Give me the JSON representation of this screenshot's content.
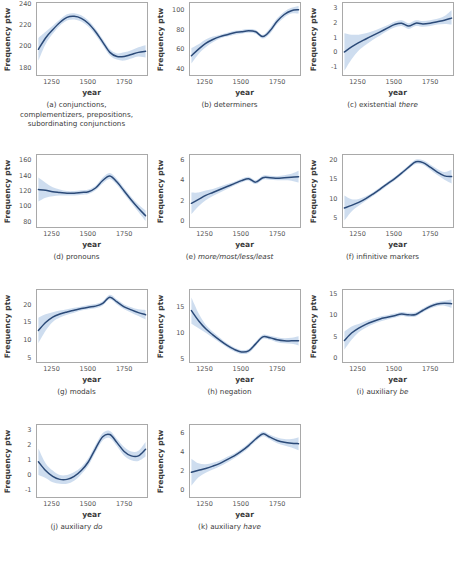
{
  "figure": {
    "axis_labels": {
      "y": "Frequency ptw",
      "x": "year"
    },
    "colors": {
      "line": "#2b4a78",
      "band": "#c6d7ec",
      "border": "#a9a9a9",
      "text": "#3a3a3a"
    }
  },
  "chart_data": [
    {
      "type": "line",
      "panel": "a",
      "caption_lines": [
        "(a) conjunctions,",
        "complementizers, prepositions,",
        "subordinating conjunctions"
      ],
      "caption_plain": "(a) conjunctions, complementizers, prepositions, subordinating conjunctions",
      "title": "conjunctions, complementizers, prepositions, subordinating conjunctions",
      "xlabel": "year",
      "ylabel": "Frequency ptw",
      "xlim": [
        1140,
        1910
      ],
      "ylim": [
        172,
        242
      ],
      "xticks": [
        1250,
        1500,
        1750
      ],
      "yticks": [
        180,
        200,
        220,
        240
      ],
      "grid": false,
      "legend": "none",
      "x": [
        1150,
        1200,
        1250,
        1300,
        1350,
        1400,
        1450,
        1500,
        1550,
        1600,
        1650,
        1700,
        1750,
        1800,
        1850,
        1900
      ],
      "y": [
        197,
        208,
        216,
        223,
        228,
        229,
        227,
        222,
        214,
        204,
        194,
        190,
        190,
        192,
        194,
        195
      ],
      "ci_low": [
        186,
        202,
        212,
        220,
        225,
        226,
        224,
        219,
        211,
        201,
        191,
        187,
        186,
        188,
        190,
        189
      ],
      "ci_high": [
        208,
        214,
        220,
        226,
        231,
        232,
        230,
        225,
        217,
        207,
        197,
        193,
        194,
        196,
        199,
        201
      ]
    },
    {
      "type": "line",
      "panel": "b",
      "caption_lines": [
        "(b) determiners"
      ],
      "caption_plain": "(b) determiners",
      "title": "determiners",
      "xlabel": "year",
      "ylabel": "Frequency ptw",
      "xlim": [
        1140,
        1910
      ],
      "ylim": [
        33,
        108
      ],
      "xticks": [
        1250,
        1500,
        1750
      ],
      "yticks": [
        40,
        60,
        80,
        100
      ],
      "grid": false,
      "legend": "none",
      "x": [
        1150,
        1200,
        1250,
        1300,
        1350,
        1400,
        1450,
        1500,
        1550,
        1600,
        1650,
        1700,
        1750,
        1800,
        1850,
        1900
      ],
      "y": [
        53,
        60,
        66,
        70,
        73,
        75,
        77,
        78,
        79,
        78,
        73,
        79,
        89,
        96,
        100,
        101
      ],
      "ci_low": [
        45,
        55,
        62,
        67,
        71,
        73,
        75,
        76,
        77,
        76,
        71,
        76,
        86,
        93,
        97,
        97
      ],
      "ci_high": [
        61,
        65,
        70,
        73,
        75,
        77,
        79,
        80,
        81,
        80,
        75,
        82,
        92,
        99,
        103,
        105
      ]
    },
    {
      "type": "line",
      "panel": "c",
      "caption_lines": [
        "(c) existential there"
      ],
      "caption_plain": "(c) existential there",
      "caption_italic_tail": "there",
      "title": "existential there",
      "xlabel": "year",
      "ylabel": "Frequency ptw",
      "xlim": [
        1140,
        1910
      ],
      "ylim": [
        -1.6,
        3.4
      ],
      "xticks": [
        1250,
        1500,
        1750
      ],
      "yticks": [
        -1,
        0,
        1,
        2,
        3
      ],
      "grid": false,
      "legend": "none",
      "x": [
        1150,
        1200,
        1250,
        1300,
        1350,
        1400,
        1450,
        1500,
        1550,
        1600,
        1650,
        1700,
        1750,
        1800,
        1850,
        1900
      ],
      "y": [
        0.0,
        0.35,
        0.65,
        0.9,
        1.15,
        1.4,
        1.65,
        1.9,
        2.0,
        1.8,
        2.0,
        1.95,
        2.0,
        2.1,
        2.2,
        2.35
      ],
      "ci_low": [
        -1.3,
        -0.5,
        0.1,
        0.5,
        0.85,
        1.15,
        1.45,
        1.7,
        1.8,
        1.6,
        1.8,
        1.75,
        1.8,
        1.9,
        1.95,
        1.9
      ],
      "ci_high": [
        1.3,
        1.2,
        1.2,
        1.3,
        1.45,
        1.65,
        1.85,
        2.1,
        2.2,
        2.0,
        2.2,
        2.15,
        2.2,
        2.3,
        2.5,
        2.9
      ]
    },
    {
      "type": "line",
      "panel": "d",
      "caption_lines": [
        "(d) pronouns"
      ],
      "caption_plain": "(d) pronouns",
      "title": "pronouns",
      "xlabel": "year",
      "ylabel": "Frequency ptw",
      "xlim": [
        1140,
        1910
      ],
      "ylim": [
        72,
        168
      ],
      "xticks": [
        1250,
        1500,
        1750
      ],
      "yticks": [
        80,
        100,
        120,
        140,
        160
      ],
      "grid": false,
      "legend": "none",
      "x": [
        1150,
        1200,
        1250,
        1300,
        1350,
        1400,
        1450,
        1500,
        1550,
        1600,
        1650,
        1700,
        1750,
        1800,
        1850,
        1900
      ],
      "y": [
        122,
        121,
        119,
        118,
        117,
        117,
        118,
        119,
        124,
        134,
        140,
        132,
        120,
        108,
        97,
        87
      ],
      "ci_low": [
        106,
        111,
        113,
        114,
        114,
        114,
        115,
        116,
        121,
        130,
        136,
        128,
        116,
        104,
        92,
        80
      ],
      "ci_high": [
        138,
        131,
        125,
        122,
        120,
        120,
        121,
        122,
        127,
        138,
        144,
        136,
        124,
        112,
        102,
        94
      ]
    },
    {
      "type": "line",
      "panel": "e",
      "caption_lines": [
        "(e) more/most/less/least"
      ],
      "caption_plain": "(e) more/most/less/least",
      "caption_italic_tail": "more/most/less/least",
      "title": "more/most/less/least",
      "xlabel": "year",
      "ylabel": "Frequency ptw",
      "xlim": [
        1140,
        1910
      ],
      "ylim": [
        -0.7,
        6.6
      ],
      "xticks": [
        1250,
        1500,
        1750
      ],
      "yticks": [
        0,
        2,
        4,
        6
      ],
      "grid": false,
      "legend": "none",
      "x": [
        1150,
        1200,
        1250,
        1300,
        1350,
        1400,
        1450,
        1500,
        1550,
        1600,
        1650,
        1700,
        1750,
        1800,
        1850,
        1900
      ],
      "y": [
        1.7,
        2.1,
        2.5,
        2.8,
        3.1,
        3.4,
        3.7,
        4.0,
        4.2,
        3.85,
        4.3,
        4.3,
        4.25,
        4.3,
        4.35,
        4.4
      ],
      "ci_low": [
        0.6,
        1.4,
        2.0,
        2.45,
        2.8,
        3.15,
        3.5,
        3.8,
        4.0,
        3.65,
        4.1,
        4.1,
        4.05,
        4.05,
        4.0,
        3.8
      ],
      "ci_high": [
        2.8,
        2.8,
        3.0,
        3.15,
        3.4,
        3.65,
        3.9,
        4.2,
        4.4,
        4.05,
        4.5,
        4.5,
        4.45,
        4.55,
        4.7,
        5.0
      ]
    },
    {
      "type": "line",
      "panel": "f",
      "caption_lines": [
        "(f) infinitive markers"
      ],
      "caption_plain": "(f) infinitive markers",
      "title": "infinitive markers",
      "xlabel": "year",
      "ylabel": "Frequency ptw",
      "xlim": [
        1140,
        1910
      ],
      "ylim": [
        2.5,
        21.5
      ],
      "xticks": [
        1250,
        1500,
        1750
      ],
      "yticks": [
        5,
        10,
        15,
        20
      ],
      "grid": false,
      "legend": "none",
      "x": [
        1150,
        1200,
        1250,
        1300,
        1350,
        1400,
        1450,
        1500,
        1550,
        1600,
        1650,
        1700,
        1750,
        1800,
        1850,
        1900
      ],
      "y": [
        7.5,
        8.2,
        9.0,
        10.0,
        11.2,
        12.5,
        13.9,
        15.2,
        16.7,
        18.3,
        19.7,
        19.5,
        18.3,
        17.0,
        16.0,
        15.8
      ],
      "ci_low": [
        4.2,
        6.6,
        8.1,
        9.4,
        10.7,
        12.0,
        13.4,
        14.7,
        16.2,
        17.8,
        19.1,
        18.9,
        17.6,
        16.2,
        15.0,
        14.0
      ],
      "ci_high": [
        10.8,
        9.8,
        9.9,
        10.6,
        11.7,
        13.0,
        14.4,
        15.7,
        17.2,
        18.8,
        20.3,
        20.1,
        19.0,
        17.8,
        17.0,
        17.6
      ]
    },
    {
      "type": "line",
      "panel": "g",
      "caption_lines": [
        "(g) modals"
      ],
      "caption_plain": "(g) modals",
      "title": "modals",
      "xlabel": "year",
      "ylabel": "Frequency ptw",
      "xlim": [
        1140,
        1910
      ],
      "ylim": [
        3.5,
        24.5
      ],
      "xticks": [
        1250,
        1500,
        1750
      ],
      "yticks": [
        5,
        10,
        15,
        20
      ],
      "grid": false,
      "legend": "none",
      "x": [
        1150,
        1200,
        1250,
        1300,
        1350,
        1400,
        1450,
        1500,
        1550,
        1600,
        1650,
        1700,
        1750,
        1800,
        1850,
        1900
      ],
      "y": [
        12.7,
        15.0,
        16.6,
        17.5,
        18.1,
        18.6,
        19.1,
        19.5,
        19.8,
        20.6,
        22.4,
        21.0,
        19.6,
        18.7,
        17.9,
        17.3
      ],
      "ci_low": [
        9.0,
        12.6,
        15.2,
        16.5,
        17.3,
        17.9,
        18.5,
        18.9,
        19.2,
        20.0,
        21.7,
        20.3,
        18.9,
        17.9,
        16.9,
        15.9
      ],
      "ci_high": [
        16.4,
        17.4,
        18.0,
        18.5,
        18.9,
        19.3,
        19.7,
        20.1,
        20.4,
        21.2,
        23.1,
        21.7,
        20.3,
        19.5,
        18.9,
        18.7
      ]
    },
    {
      "type": "line",
      "panel": "h",
      "caption_lines": [
        "(h) negation"
      ],
      "caption_plain": "(h) negation",
      "title": "negation",
      "xlabel": "year",
      "ylabel": "Frequency ptw",
      "xlim": [
        1140,
        1910
      ],
      "ylim": [
        4.2,
        18.5
      ],
      "xticks": [
        1250,
        1500,
        1750
      ],
      "yticks": [
        5,
        10,
        15
      ],
      "grid": false,
      "legend": "none",
      "x": [
        1150,
        1200,
        1250,
        1300,
        1350,
        1400,
        1450,
        1500,
        1550,
        1600,
        1650,
        1700,
        1750,
        1800,
        1850,
        1900
      ],
      "y": [
        14.4,
        12.4,
        10.8,
        9.6,
        8.5,
        7.5,
        6.7,
        6.2,
        6.4,
        7.8,
        9.2,
        9.0,
        8.6,
        8.4,
        8.4,
        8.4
      ],
      "ci_low": [
        11.8,
        10.9,
        10.0,
        9.0,
        8.0,
        7.1,
        6.3,
        5.8,
        6.0,
        7.4,
        8.8,
        8.6,
        8.1,
        7.9,
        7.8,
        7.5
      ],
      "ci_high": [
        17.0,
        13.9,
        11.6,
        10.2,
        9.0,
        7.9,
        7.1,
        6.6,
        6.8,
        8.2,
        9.6,
        9.4,
        9.1,
        8.9,
        9.0,
        9.3
      ]
    },
    {
      "type": "line",
      "panel": "i",
      "caption_lines": [
        "(i) auxiliary be"
      ],
      "caption_plain": "(i) auxiliary be",
      "caption_italic_tail": "be",
      "title": "auxiliary be",
      "xlabel": "year",
      "ylabel": "Frequency ptw",
      "xlim": [
        1140,
        1910
      ],
      "ylim": [
        -1.2,
        16.2
      ],
      "xticks": [
        1250,
        1500,
        1750
      ],
      "yticks": [
        0,
        5,
        10,
        15
      ],
      "grid": false,
      "legend": "none",
      "x": [
        1150,
        1200,
        1250,
        1300,
        1350,
        1400,
        1450,
        1500,
        1550,
        1600,
        1650,
        1700,
        1750,
        1800,
        1850,
        1900
      ],
      "y": [
        4.0,
        5.8,
        7.0,
        7.9,
        8.6,
        9.2,
        9.6,
        10.0,
        10.4,
        10.2,
        10.3,
        11.3,
        12.2,
        12.8,
        13.0,
        12.9
      ],
      "ci_low": [
        1.8,
        4.2,
        6.0,
        7.1,
        7.9,
        8.6,
        9.1,
        9.5,
        9.9,
        9.7,
        9.8,
        10.8,
        11.7,
        12.3,
        12.4,
        11.9
      ],
      "ci_high": [
        6.2,
        7.4,
        8.0,
        8.7,
        9.3,
        9.8,
        10.1,
        10.5,
        10.9,
        10.7,
        10.8,
        11.8,
        12.7,
        13.3,
        13.6,
        13.9
      ]
    },
    {
      "type": "line",
      "panel": "j",
      "caption_lines": [
        "(j) auxiliary do"
      ],
      "caption_plain": "(j) auxiliary do",
      "caption_italic_tail": "do",
      "title": "auxiliary do",
      "xlabel": "year",
      "ylabel": "Frequency ptw",
      "xlim": [
        1140,
        1910
      ],
      "ylim": [
        -1.5,
        3.4
      ],
      "xticks": [
        1250,
        1500,
        1750
      ],
      "yticks": [
        -1,
        0,
        1,
        2,
        3
      ],
      "grid": false,
      "legend": "none",
      "x": [
        1150,
        1200,
        1250,
        1300,
        1350,
        1400,
        1450,
        1500,
        1550,
        1600,
        1650,
        1700,
        1750,
        1800,
        1850,
        1900
      ],
      "y": [
        0.9,
        0.3,
        -0.1,
        -0.3,
        -0.3,
        -0.1,
        0.3,
        0.9,
        1.8,
        2.6,
        2.75,
        2.2,
        1.6,
        1.3,
        1.3,
        1.75
      ],
      "ci_low": [
        0.0,
        -0.2,
        -0.5,
        -0.6,
        -0.6,
        -0.4,
        0.05,
        0.65,
        1.55,
        2.35,
        2.5,
        1.95,
        1.3,
        1.0,
        0.95,
        1.25
      ],
      "ci_high": [
        1.8,
        0.8,
        0.3,
        0.0,
        0.0,
        0.2,
        0.55,
        1.15,
        2.05,
        2.85,
        3.0,
        2.45,
        1.9,
        1.6,
        1.65,
        2.25
      ]
    },
    {
      "type": "line",
      "panel": "k",
      "caption_lines": [
        "(k) auxiliary have"
      ],
      "caption_plain": "(k) auxiliary have",
      "caption_italic_tail": "have",
      "title": "auxiliary have",
      "xlabel": "year",
      "ylabel": "Frequency ptw",
      "xlim": [
        1140,
        1910
      ],
      "ylim": [
        -0.8,
        6.9
      ],
      "xticks": [
        1250,
        1500,
        1750
      ],
      "yticks": [
        0,
        2,
        4,
        6
      ],
      "grid": false,
      "legend": "none",
      "x": [
        1150,
        1200,
        1250,
        1300,
        1350,
        1400,
        1450,
        1500,
        1550,
        1600,
        1650,
        1700,
        1750,
        1800,
        1850,
        1900
      ],
      "y": [
        1.85,
        2.05,
        2.25,
        2.5,
        2.8,
        3.2,
        3.6,
        4.1,
        4.7,
        5.4,
        5.95,
        5.6,
        5.25,
        5.05,
        4.95,
        4.9
      ],
      "ci_low": [
        0.4,
        1.3,
        1.8,
        2.15,
        2.5,
        2.9,
        3.35,
        3.85,
        4.45,
        5.15,
        5.7,
        5.35,
        4.95,
        4.7,
        4.5,
        4.2
      ],
      "ci_high": [
        3.3,
        2.8,
        2.7,
        2.85,
        3.1,
        3.5,
        3.85,
        4.35,
        4.95,
        5.65,
        6.2,
        5.85,
        5.55,
        5.4,
        5.4,
        5.6
      ]
    }
  ]
}
